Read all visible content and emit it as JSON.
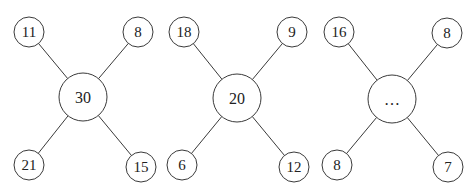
{
  "diagrams": [
    {
      "center": {
        "label": "30",
        "x": 83,
        "y": 97,
        "r": 24
      },
      "corners": [
        {
          "label": "11",
          "x": 29,
          "y": 32,
          "r": 15
        },
        {
          "label": "8",
          "x": 138,
          "y": 32,
          "r": 15
        },
        {
          "label": "21",
          "x": 29,
          "y": 165,
          "r": 15
        },
        {
          "label": "15",
          "x": 141,
          "y": 167,
          "r": 15
        }
      ]
    },
    {
      "center": {
        "label": "20",
        "x": 237,
        "y": 98,
        "r": 24
      },
      "corners": [
        {
          "label": "18",
          "x": 184,
          "y": 32,
          "r": 15
        },
        {
          "label": "9",
          "x": 292,
          "y": 32,
          "r": 15
        },
        {
          "label": "6",
          "x": 182,
          "y": 165,
          "r": 15
        },
        {
          "label": "12",
          "x": 294,
          "y": 167,
          "r": 15
        }
      ]
    },
    {
      "center": {
        "label": "…",
        "x": 392,
        "y": 99,
        "r": 24
      },
      "corners": [
        {
          "label": "16",
          "x": 339,
          "y": 32,
          "r": 15
        },
        {
          "label": "8",
          "x": 447,
          "y": 33,
          "r": 15
        },
        {
          "label": "8",
          "x": 337,
          "y": 165,
          "r": 15
        },
        {
          "label": "7",
          "x": 448,
          "y": 167,
          "r": 15
        }
      ]
    }
  ]
}
